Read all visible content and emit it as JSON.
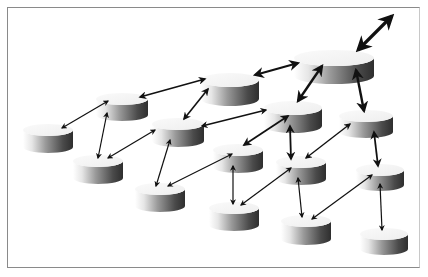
{
  "diagram": {
    "type": "network-topology",
    "colors": {
      "background": "#ffffff",
      "frame": "#8a8a8a",
      "arrow": "#111111",
      "cylinder_top_light": "#f4f4f4",
      "cylinder_side_light": "#ffffff",
      "cylinder_side_dark": "#3a3a3a"
    },
    "nodes": [
      {
        "id": "n1",
        "cx": 48,
        "cy": 130,
        "rx": 25,
        "ry": 6,
        "h": 17
      },
      {
        "id": "n2",
        "cx": 122,
        "cy": 99,
        "rx": 26,
        "ry": 6,
        "h": 16
      },
      {
        "id": "n3",
        "cx": 98,
        "cy": 161,
        "rx": 25,
        "ry": 6,
        "h": 17
      },
      {
        "id": "n4",
        "cx": 178,
        "cy": 124,
        "rx": 26,
        "ry": 6,
        "h": 17
      },
      {
        "id": "n5",
        "cx": 230,
        "cy": 80,
        "rx": 29,
        "ry": 7,
        "h": 19
      },
      {
        "id": "n6",
        "cx": 334,
        "cy": 58,
        "rx": 40,
        "ry": 8,
        "h": 18
      },
      {
        "id": "n7",
        "cx": 160,
        "cy": 189,
        "rx": 25,
        "ry": 6,
        "h": 17
      },
      {
        "id": "n8",
        "cx": 238,
        "cy": 150,
        "rx": 25,
        "ry": 6,
        "h": 17
      },
      {
        "id": "n9",
        "cx": 293,
        "cy": 108,
        "rx": 29,
        "ry": 7,
        "h": 18
      },
      {
        "id": "n10",
        "cx": 366,
        "cy": 116,
        "rx": 27,
        "ry": 6,
        "h": 16
      },
      {
        "id": "n11",
        "cx": 234,
        "cy": 208,
        "rx": 25,
        "ry": 6,
        "h": 17
      },
      {
        "id": "n12",
        "cx": 301,
        "cy": 162,
        "rx": 25,
        "ry": 6,
        "h": 17
      },
      {
        "id": "n13",
        "cx": 380,
        "cy": 170,
        "rx": 24,
        "ry": 6,
        "h": 15
      },
      {
        "id": "n14",
        "cx": 306,
        "cy": 221,
        "rx": 25,
        "ry": 6,
        "h": 18
      },
      {
        "id": "n15",
        "cx": 384,
        "cy": 234,
        "rx": 24,
        "ry": 6,
        "h": 15
      }
    ],
    "edges": [
      {
        "from": [
          62,
          128
        ],
        "to": [
          108,
          101
        ],
        "w": 1.2
      },
      {
        "from": [
          107,
          113
        ],
        "to": [
          98,
          158
        ],
        "w": 1.2
      },
      {
        "from": [
          140,
          97
        ],
        "to": [
          205,
          79
        ],
        "w": 1.6
      },
      {
        "from": [
          208,
          89
        ],
        "to": [
          184,
          119
        ],
        "w": 1.6
      },
      {
        "from": [
          255,
          75
        ],
        "to": [
          298,
          63
        ],
        "w": 2.2
      },
      {
        "from": [
          358,
          50
        ],
        "to": [
          392,
          16
        ],
        "w": 3.2,
        "big": true
      },
      {
        "from": [
          108,
          158
        ],
        "to": [
          155,
          130
        ],
        "w": 1.2
      },
      {
        "from": [
          170,
          140
        ],
        "to": [
          156,
          186
        ],
        "w": 1.2
      },
      {
        "from": [
          202,
          126
        ],
        "to": [
          266,
          110
        ],
        "w": 1.4
      },
      {
        "from": [
          322,
          66
        ],
        "to": [
          298,
          101
        ],
        "w": 2.4
      },
      {
        "from": [
          356,
          70
        ],
        "to": [
          364,
          111
        ],
        "w": 2.4
      },
      {
        "from": [
          288,
          116
        ],
        "to": [
          244,
          145
        ],
        "w": 1.8
      },
      {
        "from": [
          290,
          126
        ],
        "to": [
          291,
          159
        ],
        "w": 1.8
      },
      {
        "from": [
          350,
          124
        ],
        "to": [
          306,
          158
        ],
        "w": 1.4
      },
      {
        "from": [
          374,
          132
        ],
        "to": [
          378,
          166
        ],
        "w": 1.8
      },
      {
        "from": [
          232,
          154
        ],
        "to": [
          168,
          186
        ],
        "w": 1.2
      },
      {
        "from": [
          233,
          166
        ],
        "to": [
          233,
          204
        ],
        "w": 1.2
      },
      {
        "from": [
          291,
          168
        ],
        "to": [
          241,
          205
        ],
        "w": 1.2
      },
      {
        "from": [
          298,
          178
        ],
        "to": [
          302,
          217
        ],
        "w": 1.2
      },
      {
        "from": [
          372,
          175
        ],
        "to": [
          312,
          219
        ],
        "w": 1.2
      },
      {
        "from": [
          380,
          184
        ],
        "to": [
          382,
          230
        ],
        "w": 1.2
      }
    ]
  }
}
